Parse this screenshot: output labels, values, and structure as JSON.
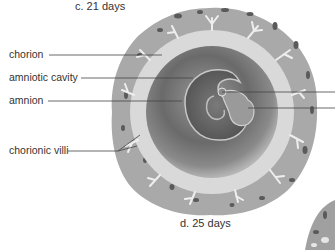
{
  "figure": {
    "panel_c_caption": "c.  21 days",
    "panel_d_caption": "d.  25 days",
    "labels": [
      {
        "id": "chorion",
        "text": "chorion"
      },
      {
        "id": "amniotic-cavity",
        "text": "amniotic cavity"
      },
      {
        "id": "amnion",
        "text": "amnion"
      },
      {
        "id": "chorionic-villi",
        "text": "chorionic villi"
      }
    ],
    "colors": {
      "outer_tissue": "#a9a9a9",
      "inner_ring": "#d9d9d9",
      "sac_dark": "#6e6e6e",
      "villi": "#f0f0f0",
      "text": "#333333"
    }
  }
}
